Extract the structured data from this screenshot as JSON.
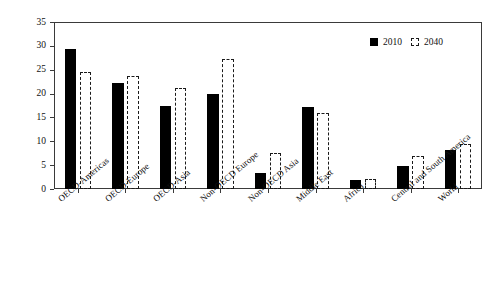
{
  "chart_data": {
    "type": "bar",
    "title": "",
    "xlabel": "",
    "ylabel": "Energy consumption (million BTU)",
    "ylim": [
      0,
      35
    ],
    "ytick_step": 5,
    "yticks": [
      0,
      5,
      10,
      15,
      20,
      25,
      30,
      35
    ],
    "grid": false,
    "legend_position": "top-right",
    "categories": [
      "OECD-Americas",
      "OECD-Europe",
      "OECD-Asia",
      "Non-OECD Europe",
      "Non-OECD Asia",
      "Middle East",
      "Africa",
      "Central and South America",
      "World"
    ],
    "series": [
      {
        "name": "2010",
        "style": "filled-black",
        "color": "#000000",
        "values": [
          29.3,
          22.3,
          17.3,
          19.9,
          3.3,
          17.2,
          1.8,
          4.9,
          8.1
        ]
      },
      {
        "name": "2040",
        "style": "dashed-outline",
        "color": "#1a1a1a",
        "values": [
          24.5,
          23.6,
          21.2,
          27.2,
          7.6,
          16.0,
          2.2,
          7.0,
          9.5
        ]
      }
    ]
  },
  "legend": {
    "items": [
      {
        "label": "2010",
        "marker": "filled-square-icon"
      },
      {
        "label": "2040",
        "marker": "dashed-square-icon"
      }
    ]
  },
  "axes": {
    "y": {
      "title": "Energy consumption (million BTU)",
      "tick_labels": [
        "0",
        "5",
        "10",
        "15",
        "20",
        "25",
        "30",
        "35"
      ]
    },
    "x": {
      "tick_labels": [
        "OECD-Americas",
        "OECD-Europe",
        "OECD-Asia",
        "Non-OECD Europe",
        "Non-OECD Asia",
        "Middle East",
        "Africa",
        "Central and South America",
        "World"
      ]
    }
  }
}
